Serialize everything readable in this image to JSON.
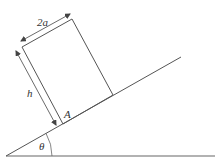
{
  "diagram": {
    "colors": {
      "line": "#555555",
      "arrow": "#444444",
      "text": "#333333",
      "background": "#ffffff"
    },
    "labels": {
      "width": "2a",
      "height": "h",
      "corner": "A",
      "angle": "θ"
    },
    "geometry": {
      "ground": {
        "x1": 6,
        "y1": 156,
        "x2": 215,
        "y2": 156
      },
      "incline": {
        "x1": 6,
        "y1": 156,
        "x2": 181,
        "y2": 57
      },
      "block": [
        [
          63,
          124
        ],
        [
          113,
          95
        ],
        [
          72,
          19
        ],
        [
          22,
          47
        ]
      ],
      "width_arrow": {
        "x1": 21,
        "y1": 41,
        "x2": 70,
        "y2": 14
      },
      "height_arrow": {
        "x1": 16,
        "y1": 51,
        "x2": 56,
        "y2": 125
      },
      "angle_arc_radius": 46
    }
  }
}
